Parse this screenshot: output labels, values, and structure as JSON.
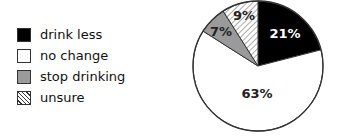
{
  "chart_data": {
    "type": "pie",
    "title": "",
    "categories": [
      "drink less",
      "no change",
      "stop drinking",
      "unsure"
    ],
    "values": [
      21,
      63,
      7,
      9
    ],
    "labels": [
      "21%",
      "63%",
      "7%",
      "9%"
    ],
    "fills": [
      "#000000",
      "#ffffff",
      "#9a9a9a",
      "hatched"
    ],
    "start_angle": "12 o'clock",
    "direction": "clockwise",
    "legend_position": "left"
  },
  "legend": {
    "items": [
      {
        "label": "drink less",
        "swatch": "black"
      },
      {
        "label": "no change",
        "swatch": "white"
      },
      {
        "label": "stop drinking",
        "swatch": "gray"
      },
      {
        "label": "unsure",
        "swatch": "hatch"
      }
    ]
  },
  "slices": {
    "drink_less": "21%",
    "no_change": "63%",
    "stop_drinking": "7%",
    "unsure": "9%"
  }
}
